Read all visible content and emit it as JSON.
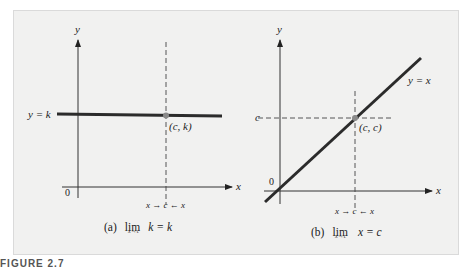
{
  "figure": {
    "label": "FIGURE 2.7",
    "panels": [
      {
        "id": "a",
        "axis_x_label": "x",
        "axis_y_label": "y",
        "origin_label": "0",
        "line_label": "y = k",
        "point_label": "(c, k)",
        "approach_label": "x → c ← x",
        "caption_prefix": "(a)",
        "caption_lim": "lim",
        "caption_sub": "x→c",
        "caption_expr": "k = k"
      },
      {
        "id": "b",
        "axis_x_label": "x",
        "axis_y_label": "y",
        "origin_label": "0",
        "line_label": "y = x",
        "y_tick_label": "c",
        "point_label": "(c, c)",
        "approach_label": "x → c ← x",
        "caption_prefix": "(b)",
        "caption_lim": "lim",
        "caption_sub": "x→c",
        "caption_expr": "x = c"
      }
    ],
    "colors": {
      "panel_bg": "#f1f1f0",
      "line": "#2b2b2b",
      "point": "#8a8a8a",
      "axis": "#333333"
    }
  }
}
